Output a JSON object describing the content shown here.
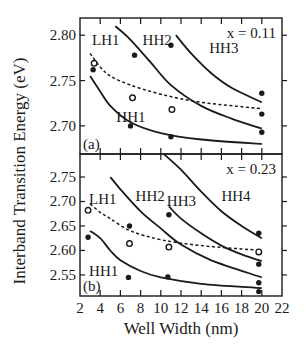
{
  "chart_data": [
    {
      "type": "line",
      "panel": "(a)",
      "annotation": "x = 0.11",
      "xlabel": "Well Width (nm)",
      "ylabel": "Interband Transition Energy (eV)",
      "xlim": [
        2,
        22
      ],
      "ylim": [
        2.669,
        2.819
      ],
      "yticks": [
        2.7,
        2.75,
        2.8
      ],
      "ytick_labels": [
        "2.70",
        "2.75",
        "2.80"
      ],
      "grid": false,
      "series": [
        {
          "name": "HH1",
          "style": "solid",
          "label_pos": [
            5.6,
            2.704
          ],
          "x": [
            3.0,
            4.0,
            5.0,
            7.0,
            10.0,
            14.0,
            20.0
          ],
          "y": [
            2.755,
            2.738,
            2.722,
            2.704,
            2.692,
            2.685,
            2.68
          ]
        },
        {
          "name": "LH1",
          "style": "dashed",
          "label_pos": [
            3.2,
            2.789
          ],
          "x": [
            3.0,
            4.0,
            5.0,
            7.0,
            10.0,
            14.0,
            20.0
          ],
          "y": [
            2.78,
            2.765,
            2.755,
            2.745,
            2.735,
            2.726,
            2.719
          ]
        },
        {
          "name": "HH2",
          "style": "solid",
          "label_pos": [
            8.2,
            2.789
          ],
          "x": [
            5.5,
            7.0,
            9.0,
            11.0,
            14.0,
            17.0,
            20.0
          ],
          "y": [
            2.81,
            2.795,
            2.77,
            2.745,
            2.722,
            2.708,
            2.697
          ]
        },
        {
          "name": "HH3",
          "style": "solid",
          "label_pos": [
            14.8,
            2.78
          ],
          "x": [
            11.5,
            13.0,
            15.0,
            17.0,
            20.0
          ],
          "y": [
            2.8,
            2.78,
            2.758,
            2.742,
            2.726
          ]
        }
      ],
      "points": {
        "filled": [
          {
            "x": 3.3,
            "y": 2.762
          },
          {
            "x": 7.4,
            "y": 2.778
          },
          {
            "x": 7.0,
            "y": 2.7
          },
          {
            "x": 11.0,
            "y": 2.789
          },
          {
            "x": 11.0,
            "y": 2.688
          },
          {
            "x": 20.0,
            "y": 2.736
          },
          {
            "x": 20.0,
            "y": 2.713
          },
          {
            "x": 20.0,
            "y": 2.693
          }
        ],
        "open": [
          {
            "x": 3.4,
            "y": 2.769
          },
          {
            "x": 7.2,
            "y": 2.731
          },
          {
            "x": 11.1,
            "y": 2.718
          }
        ]
      }
    },
    {
      "type": "line",
      "panel": "(b)",
      "annotation": "x = 0.23",
      "xlabel": "Well Width (nm)",
      "ylabel": "Interband Transition Energy (eV)",
      "xlim": [
        2,
        22
      ],
      "ylim": [
        2.507,
        2.797
      ],
      "xticks": [
        2,
        4,
        6,
        8,
        10,
        12,
        14,
        16,
        18,
        20,
        22
      ],
      "xtick_labels": [
        "2",
        "4",
        "6",
        "8",
        "10",
        "12",
        "14",
        "16",
        "18",
        "20",
        "22"
      ],
      "yticks": [
        2.55,
        2.6,
        2.65,
        2.7,
        2.75
      ],
      "ytick_labels": [
        "2.55",
        "2.60",
        "2.65",
        "2.70",
        "2.75"
      ],
      "grid": false,
      "series": [
        {
          "name": "HH1",
          "style": "solid",
          "label_pos": [
            2.9,
            2.548
          ],
          "x": [
            3.0,
            4.0,
            5.0,
            6.0,
            8.0,
            10.0,
            14.0,
            20.0
          ],
          "y": [
            2.64,
            2.625,
            2.6,
            2.58,
            2.558,
            2.545,
            2.532,
            2.523
          ]
        },
        {
          "name": "LH1",
          "style": "dashed",
          "label_pos": [
            2.9,
            2.695
          ],
          "x": [
            3.0,
            4.0,
            5.0,
            7.0,
            10.0,
            14.0,
            20.0
          ],
          "y": [
            2.695,
            2.678,
            2.665,
            2.64,
            2.622,
            2.61,
            2.6
          ]
        },
        {
          "name": "HH2",
          "style": "solid",
          "label_pos": [
            7.5,
            2.7
          ],
          "x": [
            5.0,
            6.0,
            8.0,
            10.0,
            12.0,
            15.0,
            20.0
          ],
          "y": [
            2.75,
            2.725,
            2.68,
            2.645,
            2.612,
            2.58,
            2.545
          ]
        },
        {
          "name": "HH3",
          "style": "solid",
          "label_pos": [
            10.6,
            2.69
          ],
          "x": [
            10.8,
            12.0,
            14.0,
            16.0,
            18.0,
            20.0
          ],
          "y": [
            2.69,
            2.665,
            2.635,
            2.61,
            2.592,
            2.578
          ]
        },
        {
          "name": "HH4",
          "style": "solid",
          "label_pos": [
            16.0,
            2.7
          ],
          "x": [
            10.3,
            12.0,
            14.0,
            16.0,
            18.0,
            20.0
          ],
          "y": [
            2.797,
            2.765,
            2.72,
            2.68,
            2.65,
            2.625
          ]
        }
      ],
      "points": {
        "filled": [
          {
            "x": 2.8,
            "y": 2.627
          },
          {
            "x": 6.9,
            "y": 2.65
          },
          {
            "x": 6.8,
            "y": 2.545
          },
          {
            "x": 10.8,
            "y": 2.673
          },
          {
            "x": 10.7,
            "y": 2.546
          },
          {
            "x": 19.7,
            "y": 2.635
          },
          {
            "x": 19.7,
            "y": 2.572
          },
          {
            "x": 19.7,
            "y": 2.534
          },
          {
            "x": 19.7,
            "y": 2.516
          }
        ],
        "open": [
          {
            "x": 2.8,
            "y": 2.682
          },
          {
            "x": 6.9,
            "y": 2.614
          },
          {
            "x": 10.8,
            "y": 2.607
          },
          {
            "x": 19.7,
            "y": 2.597
          }
        ]
      }
    }
  ],
  "labels": {
    "xlabel": "Well Width (nm)",
    "ylabel": "Interband Transition Energy (eV)",
    "panel_a": "(a)",
    "panel_b": "(b)",
    "annotation_a": "x = 0.11",
    "annotation_b": "x = 0.23"
  },
  "layout": {
    "plot_left": 80,
    "plot_right": 282,
    "panel_a": {
      "top": 18,
      "bottom": 154
    },
    "panel_b": {
      "top": 154,
      "bottom": 296
    }
  }
}
